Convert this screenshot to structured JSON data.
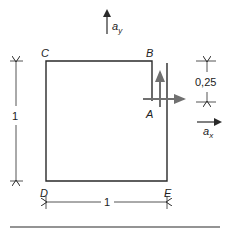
{
  "diagram": {
    "labels": {
      "C": "C",
      "B": "B",
      "A": "A",
      "D": "D",
      "E": "E"
    },
    "unit_vectors": {
      "ay_base": "a",
      "ay_sub": "y",
      "ax_base": "a",
      "ax_sub": "x"
    },
    "dimensions": {
      "left_height": "1",
      "bottom_width": "1",
      "right_gap": "0,25"
    },
    "colors": {
      "line": "#2a2a2a",
      "arrow_gray": "#707070",
      "background": "#ffffff"
    }
  }
}
